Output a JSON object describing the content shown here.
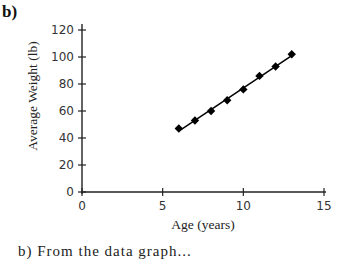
{
  "panel_label": "b)",
  "chart_data": {
    "type": "scatter",
    "title": "",
    "xlabel": "Age (years)",
    "ylabel": "Average Weight (lb)",
    "xlim": [
      0,
      15
    ],
    "ylim": [
      0,
      120
    ],
    "xticks": [
      0,
      5,
      10,
      15
    ],
    "yticks": [
      0,
      20,
      40,
      60,
      80,
      100,
      120
    ],
    "grid": false,
    "legend": "none",
    "series": [
      {
        "name": "Average Weight",
        "marker": "diamond",
        "trendline": "linear",
        "x": [
          6,
          7,
          8,
          9,
          10,
          11,
          12,
          13
        ],
        "y": [
          47,
          53,
          60,
          68,
          76,
          86,
          93,
          102
        ]
      }
    ]
  },
  "caption_fragment": "b)  From the data graph..."
}
